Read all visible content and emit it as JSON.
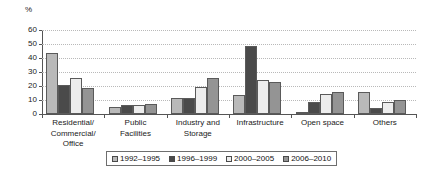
{
  "chart_data": {
    "type": "bar",
    "title": "",
    "xlabel": "",
    "ylabel": "%",
    "ylim": [
      0,
      60
    ],
    "yticks": [
      0,
      10,
      20,
      30,
      40,
      50,
      60
    ],
    "grid": true,
    "legend_position": "bottom",
    "categories": [
      "Residential/\nCommercial/\nOffice",
      "Public\nFacilities",
      "Industry and\nStorage",
      "Infrastructure",
      "Open space",
      "Others"
    ],
    "series": [
      {
        "name": "1992–1995",
        "color": "#b9b9b9",
        "values": [
          43.5,
          5.3,
          11.5,
          13.5,
          1.0,
          16.0
        ]
      },
      {
        "name": "1996–1999",
        "color": "#4a4a4a",
        "values": [
          20.5,
          6.4,
          11.5,
          48.3,
          8.4,
          4.4
        ]
      },
      {
        "name": "2000–2005",
        "color": "#ededed",
        "values": [
          25.7,
          6.6,
          19.4,
          24.3,
          14.2,
          8.9
        ]
      },
      {
        "name": "2006–2010",
        "color": "#949494",
        "values": [
          18.5,
          6.9,
          25.5,
          23.0,
          15.6,
          9.7
        ]
      }
    ]
  },
  "axis": {
    "unit_label": "%",
    "tick_labels": [
      "60",
      "50",
      "40",
      "30",
      "20",
      "10",
      "0"
    ]
  },
  "categories_display": [
    {
      "line1": "Residential/",
      "line2": "Commercial/",
      "line3": "Office"
    },
    {
      "line1": "Public",
      "line2": "Facilities",
      "line3": ""
    },
    {
      "line1": "Industry and",
      "line2": "Storage",
      "line3": ""
    },
    {
      "line1": "Infrastructure",
      "line2": "",
      "line3": ""
    },
    {
      "line1": "Open space",
      "line2": "",
      "line3": ""
    },
    {
      "line1": "Others",
      "line2": "",
      "line3": ""
    }
  ],
  "legend": {
    "items": [
      {
        "label": "1992–1995",
        "color": "#b9b9b9"
      },
      {
        "label": "1996–1999",
        "color": "#4a4a4a"
      },
      {
        "label": "2000–2005",
        "color": "#ededed"
      },
      {
        "label": "2006–2010",
        "color": "#949494"
      }
    ]
  }
}
